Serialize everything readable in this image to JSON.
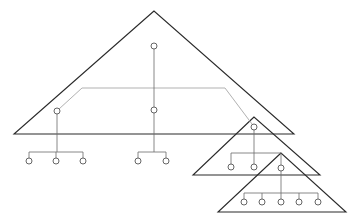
{
  "diagram": {
    "type": "nested-tree-triangles",
    "colors": {
      "background": "#ffffff",
      "triangle_stroke": "#2a2a2a",
      "edge_stroke": "#6a6a6a",
      "highlight_path": "#a8a8a8",
      "node_stroke": "#555555"
    },
    "triangles": [
      {
        "id": "big",
        "points": "154,11 14,134 294,134"
      },
      {
        "id": "mid",
        "points": "254,117 193,175 320,175"
      },
      {
        "id": "small",
        "points": "281,153 218,212 346,212"
      }
    ],
    "nodes": [
      {
        "id": "root",
        "cx": 154,
        "cy": 46
      },
      {
        "id": "left",
        "cx": 57,
        "cy": 111
      },
      {
        "id": "center",
        "cx": 154,
        "cy": 110
      },
      {
        "id": "l1",
        "cx": 29,
        "cy": 161
      },
      {
        "id": "l2",
        "cx": 56,
        "cy": 161
      },
      {
        "id": "l3",
        "cx": 83,
        "cy": 161
      },
      {
        "id": "c1",
        "cx": 138,
        "cy": 161
      },
      {
        "id": "c2",
        "cx": 166,
        "cy": 161
      },
      {
        "id": "m",
        "cx": 254,
        "cy": 127
      },
      {
        "id": "m1",
        "cx": 231,
        "cy": 167
      },
      {
        "id": "m2",
        "cx": 254,
        "cy": 167
      },
      {
        "id": "s",
        "cx": 281,
        "cy": 168
      },
      {
        "id": "s1",
        "cx": 244,
        "cy": 202
      },
      {
        "id": "s2",
        "cx": 262,
        "cy": 202
      },
      {
        "id": "s3",
        "cx": 281,
        "cy": 202
      },
      {
        "id": "s4",
        "cx": 299,
        "cy": 202
      },
      {
        "id": "s5",
        "cx": 318,
        "cy": 202
      }
    ],
    "edges": [
      "M154,49 V107",
      "M154,113 V152 M138,152 H166 M138,152 V158 M166,152 V158",
      "M57,114 V152 M29,152 H83 M29,152 V158 M56,152 V158 M83,152 V158",
      "M254,130 V153 M231,153 H281 M231,153 V164 M254,153 V164 M281,153 V165",
      "M281,171 V193 M244,193 H318 M244,193 V199 M262,193 V199 M281,193 V199 M299,193 V199 M318,193 V199"
    ],
    "highlight_path": "M59,109 L82,88 L225,88 L252,124"
  }
}
